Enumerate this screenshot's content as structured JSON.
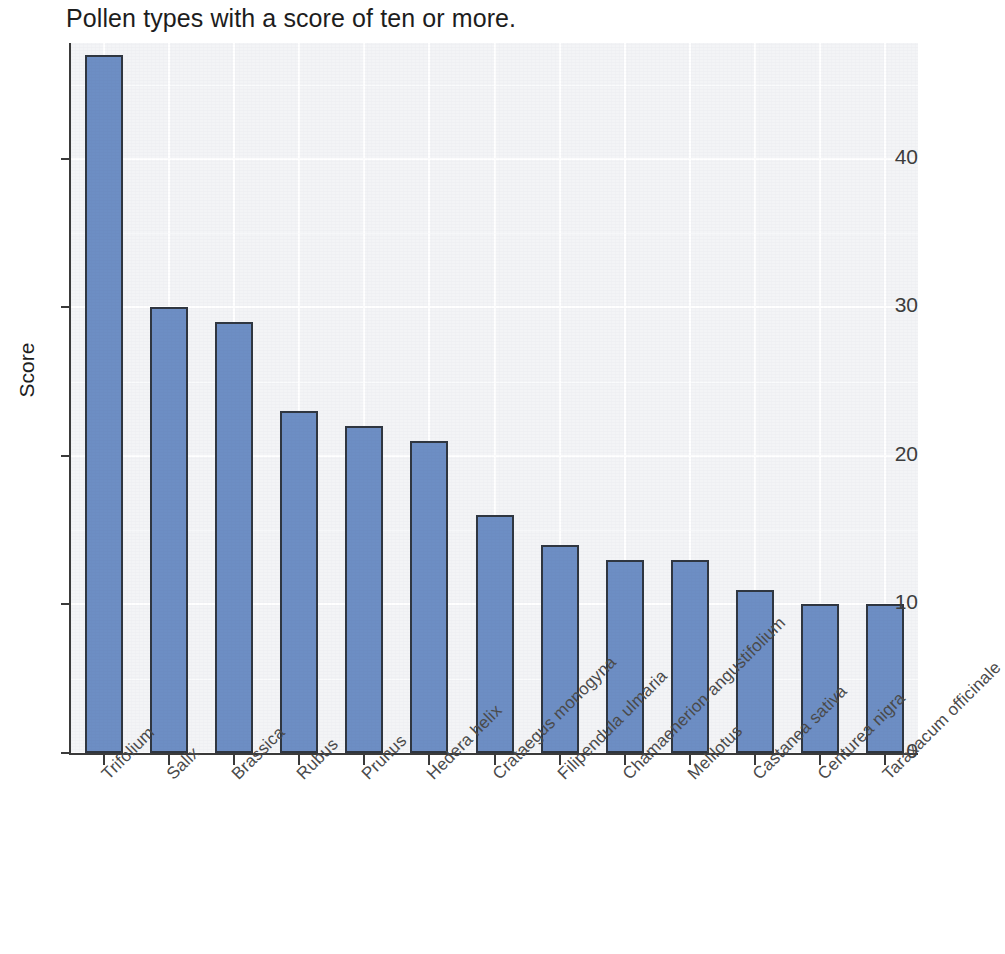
{
  "chart_data": {
    "type": "bar",
    "title": "Pollen types with a score of ten or more.",
    "xlabel": "",
    "ylabel": "Score",
    "categories": [
      "Trifolium",
      "Salix",
      "Brassica",
      "Rubus",
      "Prunus",
      "Hedera helix",
      "Crataegus monogyna",
      "Filipendula ulmaria",
      "Chamaenerion angustifolium",
      "Melilotus",
      "Castanea sativa",
      "Centurea nigra",
      "Taraxacum officinale"
    ],
    "values": [
      47,
      30,
      29,
      23,
      22,
      21,
      16,
      14,
      13,
      13,
      11,
      10,
      10
    ],
    "ylim": [
      0,
      47.8
    ],
    "ytick_labels": [
      "0",
      "10",
      "20",
      "30",
      "40"
    ],
    "ytick_values": [
      0,
      10,
      20,
      30,
      40
    ],
    "grid": true,
    "legend": "none",
    "bar_color": "#6d8ec4",
    "bar_border_color": "#2f3640",
    "panel_background": "#f3f4f6",
    "gridline_color": "#ffffff",
    "axis_color": "#3a3a3a",
    "text_color": "#1d1d1d"
  }
}
